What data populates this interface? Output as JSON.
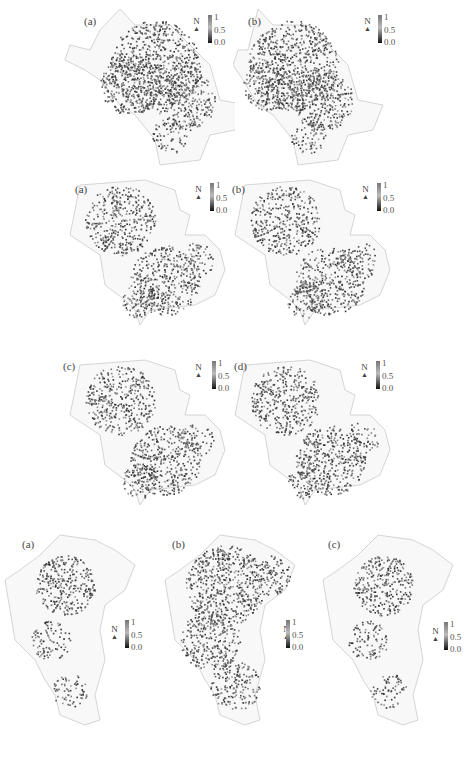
{
  "figure": {
    "groups": [
      {
        "name": "top-group",
        "panels": [
          {
            "label": "(a)",
            "north": "N",
            "legend": {
              "max": "1",
              "mid": "0.5",
              "min": "0.0"
            }
          },
          {
            "label": "(b)",
            "north": "N",
            "legend": {
              "max": "1",
              "mid": "0.5",
              "min": "0.0"
            }
          }
        ]
      },
      {
        "name": "middle-group-row1",
        "panels": [
          {
            "label": "(a)",
            "north": "N",
            "legend": {
              "max": "1",
              "mid": "0.5",
              "min": "0.0"
            }
          },
          {
            "label": "(b)",
            "north": "N",
            "legend": {
              "max": "1",
              "mid": "0.5",
              "min": "0.0"
            }
          }
        ]
      },
      {
        "name": "middle-group-row2",
        "panels": [
          {
            "label": "(c)",
            "north": "N",
            "legend": {
              "max": "1",
              "mid": "0.5",
              "min": "0.0"
            }
          },
          {
            "label": "(d)",
            "north": "N",
            "legend": {
              "max": "1",
              "mid": "0.5",
              "min": "0.0"
            }
          }
        ]
      },
      {
        "name": "bottom-group",
        "panels": [
          {
            "label": "(a)",
            "north": "N",
            "legend": {
              "max": "1",
              "mid": "0.5",
              "min": "0.0"
            }
          },
          {
            "label": "(b)",
            "north": "N",
            "legend": {
              "max": "1",
              "mid": "0.5",
              "min": "0.0"
            }
          },
          {
            "label": "(c)",
            "north": "N",
            "legend": {
              "max": "1",
              "mid": "0.5",
              "min": "0.0"
            }
          }
        ]
      }
    ],
    "colorscale": {
      "low": "#111111",
      "mid": "#bbbbbb",
      "high": "#777777"
    }
  }
}
